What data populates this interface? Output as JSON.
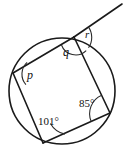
{
  "figure": {
    "shape_type": "cyclic-quadrilateral",
    "stroke_color": "#1a1a1a",
    "background_color": "#ffffff",
    "circle": {
      "center_x": 62,
      "center_y": 91,
      "radius": 53
    },
    "vertices": [
      {
        "id": "top",
        "x": 74,
        "y": 37
      },
      {
        "id": "left",
        "x": 13,
        "y": 73
      },
      {
        "id": "bottom",
        "x": 43,
        "y": 143
      },
      {
        "id": "right",
        "x": 110,
        "y": 113
      }
    ],
    "exterior_ray": {
      "from_vertex": "top",
      "end_x": 122,
      "end_y": 4
    },
    "angle_labels": [
      {
        "id": "p",
        "text": "p",
        "vertex": "left",
        "italic": true,
        "known": false
      },
      {
        "id": "q",
        "text": "q",
        "vertex": "top",
        "italic": true,
        "known": false
      },
      {
        "id": "r",
        "text": "r",
        "vertex": "top",
        "italic": true,
        "known": false
      },
      {
        "id": "a101",
        "text": "101°",
        "vertex": "bottom",
        "italic": false,
        "known": true
      },
      {
        "id": "a85",
        "text": "85°",
        "vertex": "right",
        "italic": false,
        "known": true
      }
    ]
  }
}
